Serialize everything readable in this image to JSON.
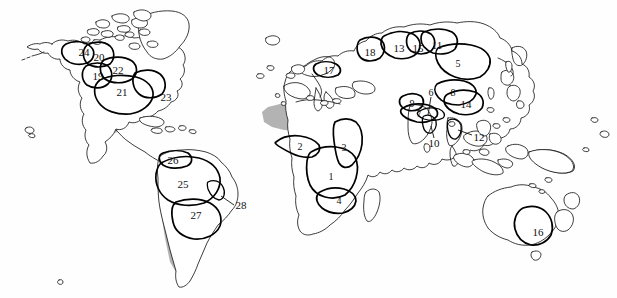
{
  "figure": {
    "type": "world-map",
    "background_color": "#fefefe",
    "coastline_color": "#1a1a1a",
    "region_outline_color": "#000000",
    "shading_color": "#b3b3b3",
    "shading_meaning": "arid / desert zones"
  },
  "regions": [
    {
      "id": "1",
      "label": "1",
      "x": 331,
      "y": 176,
      "continent": "Africa",
      "leader": null
    },
    {
      "id": "2",
      "label": "2",
      "x": 300,
      "y": 146,
      "continent": "Africa",
      "leader": null
    },
    {
      "id": "3",
      "label": "3",
      "x": 344,
      "y": 147,
      "continent": "Africa",
      "leader": null
    },
    {
      "id": "4",
      "label": "4",
      "x": 339,
      "y": 200,
      "continent": "Africa",
      "leader": null
    },
    {
      "id": "5",
      "label": "5",
      "x": 458,
      "y": 63,
      "continent": "Asia",
      "leader": null
    },
    {
      "id": "6",
      "label": "6",
      "x": 431,
      "y": 92,
      "continent": "Asia",
      "leader": {
        "x1": 431,
        "y1": 97,
        "x2": 428,
        "y2": 115
      }
    },
    {
      "id": "7",
      "label": "7",
      "x": 419,
      "y": 113,
      "continent": "Asia",
      "leader": null
    },
    {
      "id": "8",
      "label": "8",
      "x": 453,
      "y": 92,
      "continent": "Asia",
      "leader": null
    },
    {
      "id": "9",
      "label": "9",
      "x": 412,
      "y": 103,
      "continent": "Asia",
      "leader": null
    },
    {
      "id": "10",
      "label": "10",
      "x": 434,
      "y": 143,
      "continent": "Asia",
      "leader": {
        "x1": 434,
        "y1": 138,
        "x2": 431,
        "y2": 126
      }
    },
    {
      "id": "11",
      "label": "11",
      "x": 437,
      "y": 45,
      "continent": "Asia",
      "leader": null
    },
    {
      "id": "12",
      "label": "12",
      "x": 479,
      "y": 137,
      "continent": "Asia",
      "leader": {
        "x1": 472,
        "y1": 135,
        "x2": 458,
        "y2": 130
      }
    },
    {
      "id": "13",
      "label": "13",
      "x": 399,
      "y": 48,
      "continent": "Asia",
      "leader": null
    },
    {
      "id": "14",
      "label": "14",
      "x": 466,
      "y": 104,
      "continent": "Asia",
      "leader": null
    },
    {
      "id": "15",
      "label": "15",
      "x": 418,
      "y": 48,
      "continent": "Asia",
      "leader": null
    },
    {
      "id": "16",
      "label": "16",
      "x": 538,
      "y": 232,
      "continent": "Australia",
      "leader": null
    },
    {
      "id": "17",
      "label": "17",
      "x": 329,
      "y": 70,
      "continent": "Europe",
      "leader": null
    },
    {
      "id": "18",
      "label": "18",
      "x": 370,
      "y": 52,
      "continent": "Europe",
      "leader": null
    },
    {
      "id": "19",
      "label": "19",
      "x": 98,
      "y": 76,
      "continent": "North America",
      "leader": null
    },
    {
      "id": "20",
      "label": "20",
      "x": 99,
      "y": 57,
      "continent": "North America",
      "leader": null
    },
    {
      "id": "21",
      "label": "21",
      "x": 122,
      "y": 92,
      "continent": "North America",
      "leader": null
    },
    {
      "id": "22",
      "label": "22",
      "x": 118,
      "y": 70,
      "continent": "North America",
      "leader": null
    },
    {
      "id": "23",
      "label": "23",
      "x": 166,
      "y": 97,
      "continent": "North America",
      "leader": null
    },
    {
      "id": "24",
      "label": "24",
      "x": 84,
      "y": 52,
      "continent": "North America",
      "leader": null
    },
    {
      "id": "25",
      "label": "25",
      "x": 183,
      "y": 184,
      "continent": "South America",
      "leader": null
    },
    {
      "id": "26",
      "label": "26",
      "x": 173,
      "y": 160,
      "continent": "South America",
      "leader": null
    },
    {
      "id": "27",
      "label": "27",
      "x": 196,
      "y": 215,
      "continent": "South America",
      "leader": null
    },
    {
      "id": "28",
      "label": "28",
      "x": 241,
      "y": 205,
      "continent": "South America",
      "leader": {
        "x1": 234,
        "y1": 205,
        "x2": 221,
        "y2": 196
      }
    }
  ]
}
